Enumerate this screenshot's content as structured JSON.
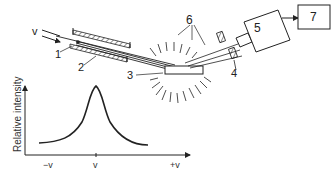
{
  "diagram": {
    "components": [
      {
        "id": "1",
        "label": "1"
      },
      {
        "id": "2",
        "label": "2"
      },
      {
        "id": "3",
        "label": "3"
      },
      {
        "id": "4",
        "label": "4"
      },
      {
        "id": "5",
        "label": "5"
      },
      {
        "id": "6",
        "label": "6"
      },
      {
        "id": "7",
        "label": "7"
      }
    ],
    "motion": {
      "velocity_label": "v",
      "minus": "−",
      "plus": "+"
    },
    "plot": {
      "ylabel": "Relative intensity",
      "xticks": [
        "−v",
        "v",
        "+v"
      ]
    },
    "colors": {
      "ink": "#222222",
      "background": "#ffffff"
    }
  }
}
